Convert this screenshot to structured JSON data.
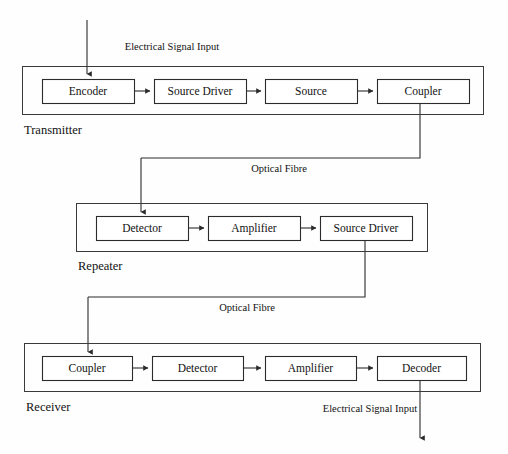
{
  "diagram": {
    "stroke_color": "#2b2b2b",
    "frame_color": "#3a3a3a",
    "background_color": "#fefefe"
  },
  "stages": [
    {
      "id": "transmitter",
      "label": "Transmitter",
      "frame": {
        "x": 22,
        "y": 66,
        "w": 461,
        "h": 48
      },
      "label_pos": {
        "x": 24,
        "y": 131
      },
      "nodes": [
        {
          "id": "encoder",
          "label": "Encoder",
          "x": 42,
          "y": 79,
          "w": 92,
          "h": 24
        },
        {
          "id": "source-driver",
          "label": "Source Driver",
          "x": 154,
          "y": 79,
          "w": 92,
          "h": 24
        },
        {
          "id": "source",
          "label": "Source",
          "x": 265,
          "y": 79,
          "w": 92,
          "h": 24
        },
        {
          "id": "coupler",
          "label": "Coupler",
          "x": 377,
          "y": 79,
          "w": 92,
          "h": 24
        }
      ]
    },
    {
      "id": "repeater",
      "label": "Repeater",
      "frame": {
        "x": 76,
        "y": 203,
        "w": 351,
        "h": 48
      },
      "label_pos": {
        "x": 78,
        "y": 267
      },
      "nodes": [
        {
          "id": "detector",
          "label": "Detector",
          "x": 96,
          "y": 216,
          "w": 92,
          "h": 24
        },
        {
          "id": "amplifier",
          "label": "Amplifier",
          "x": 208,
          "y": 216,
          "w": 92,
          "h": 24
        },
        {
          "id": "source-driver2",
          "label": "Source Driver",
          "x": 320,
          "y": 216,
          "w": 92,
          "h": 24
        }
      ]
    },
    {
      "id": "receiver",
      "label": "Receiver",
      "frame": {
        "x": 24,
        "y": 343,
        "w": 456,
        "h": 48
      },
      "label_pos": {
        "x": 26,
        "y": 408
      },
      "nodes": [
        {
          "id": "coupler2",
          "label": "Coupler",
          "x": 42,
          "y": 356,
          "w": 90,
          "h": 24
        },
        {
          "id": "detector2",
          "label": "Detector",
          "x": 152,
          "y": 356,
          "w": 91,
          "h": 24
        },
        {
          "id": "amplifier2",
          "label": "Amplifier",
          "x": 265,
          "y": 356,
          "w": 91,
          "h": 24
        },
        {
          "id": "decoder",
          "label": "Decoder",
          "x": 377,
          "y": 356,
          "w": 89,
          "h": 24
        }
      ]
    }
  ],
  "edge_labels": [
    {
      "id": "electrical-input-top",
      "text": "Electrical Signal Input",
      "x": 172,
      "y": 48
    },
    {
      "id": "optical-fibre-1",
      "text": "Optical Fibre",
      "x": 279,
      "y": 170
    },
    {
      "id": "optical-fibre-2",
      "text": "Optical Fibre",
      "x": 247,
      "y": 309
    },
    {
      "id": "electrical-output-bottom",
      "text": "Electrical Signal Input",
      "x": 370,
      "y": 410
    }
  ],
  "connectors": [
    {
      "id": "input-to-encoder",
      "type": "arrow-down",
      "d": "M 87 20 L 87 74"
    },
    {
      "id": "encoder-to-source-driver",
      "type": "arrow-right",
      "d": "M 134 91 L 150 91"
    },
    {
      "id": "source-driver-to-source",
      "type": "arrow-right",
      "d": "M 246 91 L 261 91"
    },
    {
      "id": "source-to-coupler",
      "type": "arrow-right",
      "d": "M 357 91 L 373 91"
    },
    {
      "id": "coupler-to-fibre-1",
      "type": "plain",
      "d": "M 420 103 L 420 158 L 141 158"
    },
    {
      "id": "fibre-1-to-detector",
      "type": "arrow-down",
      "d": "M 141 158 L 141 212"
    },
    {
      "id": "detector-to-amplifier",
      "type": "arrow-right",
      "d": "M 188 228 L 204 228"
    },
    {
      "id": "amplifier-to-source-driver2",
      "type": "arrow-right",
      "d": "M 300 228 L 316 228"
    },
    {
      "id": "source-driver2-to-fibre-2",
      "type": "plain",
      "d": "M 365 240 L 365 297 L 88 297"
    },
    {
      "id": "fibre-2-to-coupler2",
      "type": "arrow-down",
      "d": "M 88 297 L 88 352"
    },
    {
      "id": "coupler2-to-detector2",
      "type": "arrow-right",
      "d": "M 132 368 L 148 368"
    },
    {
      "id": "detector2-to-amplifier2",
      "type": "arrow-right",
      "d": "M 243 368 L 261 368"
    },
    {
      "id": "amplifier2-to-decoder",
      "type": "arrow-right",
      "d": "M 356 368 L 373 368"
    },
    {
      "id": "decoder-to-output",
      "type": "arrow-down",
      "d": "M 420 380 L 420 438"
    }
  ]
}
